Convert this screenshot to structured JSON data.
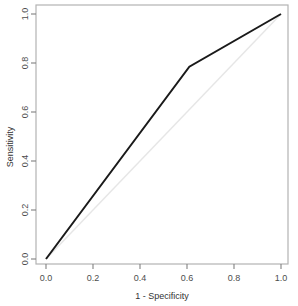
{
  "chart_data": {
    "type": "line",
    "title": "",
    "subtitle": "",
    "xlabel": "1 - Specificity",
    "ylabel": "Sensitivity",
    "xlim": [
      0,
      1
    ],
    "ylim": [
      0,
      1
    ],
    "xticks": [
      "0.0",
      "0.2",
      "0.4",
      "0.6",
      "0.8",
      "1.0"
    ],
    "xtick_values": [
      0.0,
      0.2,
      0.4,
      0.6,
      0.8,
      1.0
    ],
    "yticks": [
      "0.0",
      "0.2",
      "0.4",
      "0.6",
      "0.8",
      "1.0"
    ],
    "ytick_values": [
      0.0,
      0.2,
      0.4,
      0.6,
      0.8,
      1.0
    ],
    "grid": false,
    "legend": null,
    "series": [
      {
        "name": "ROC curve",
        "color": "#1a1a1a",
        "width": 2,
        "x": [
          0.0,
          0.61,
          1.0
        ],
        "values": [
          0.0,
          0.785,
          1.0
        ]
      },
      {
        "name": "Chance diagonal",
        "color": "#e6e6e6",
        "width": 1.4,
        "x": [
          0.0,
          1.0
        ],
        "values": [
          0.0,
          1.0
        ]
      }
    ]
  },
  "axes": {
    "box_color": "#b3b3b3",
    "tick_color": "#808080",
    "x_axis_title": "1 - Specificity",
    "y_axis_title": "Sensitivity"
  },
  "ticks": {
    "x": [
      {
        "label": "0.0",
        "px": 46
      },
      {
        "label": "0.2",
        "px": 93
      },
      {
        "label": "0.4",
        "px": 140
      },
      {
        "label": "0.6",
        "px": 187
      },
      {
        "label": "0.8",
        "px": 234
      },
      {
        "label": "1.0",
        "px": 281
      }
    ],
    "y": [
      {
        "label": "0.0",
        "px": 259
      },
      {
        "label": "0.2",
        "px": 210
      },
      {
        "label": "0.4",
        "px": 161
      },
      {
        "label": "0.6",
        "px": 112
      },
      {
        "label": "0.8",
        "px": 63
      },
      {
        "label": "1.0",
        "px": 14
      }
    ]
  }
}
